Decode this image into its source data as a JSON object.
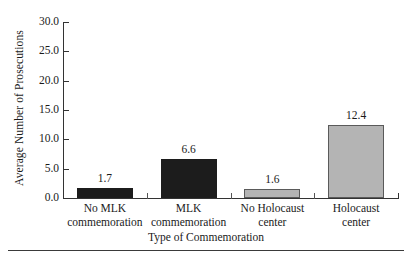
{
  "chart_data": {
    "type": "bar",
    "title": "",
    "xlabel": "Type of Commemoration",
    "ylabel": "Average Number of Prosecutions",
    "ylim": [
      0.0,
      30.0
    ],
    "ytick_labels": [
      "0.0",
      "5.0",
      "10.0",
      "15.0",
      "20.0",
      "25.0",
      "30.0"
    ],
    "ytick_values": [
      0.0,
      5.0,
      10.0,
      15.0,
      20.0,
      25.0,
      30.0
    ],
    "grid": false,
    "legend": "none",
    "categories": [
      "No MLK commemoration",
      "MLK commemoration",
      "No Holocaust center",
      "Holocaust center"
    ],
    "category_lines": [
      {
        "line1": "No MLK",
        "line2": "commemoration"
      },
      {
        "line1": "MLK",
        "line2": "commemoration"
      },
      {
        "line1": "No Holocaust",
        "line2": "center"
      },
      {
        "line1": "Holocaust",
        "line2": "center"
      }
    ],
    "values": [
      1.7,
      6.6,
      1.6,
      12.4
    ],
    "value_labels": [
      "1.7",
      "6.6",
      "1.6",
      "12.4"
    ],
    "bar_colors": [
      "#1c1c1c",
      "#1c1c1c",
      "#b4b4b4",
      "#b4b4b4"
    ],
    "bar_styles": [
      "dark",
      "dark",
      "light",
      "light"
    ]
  },
  "colors": {
    "dark_bar": "#1c1c1c",
    "light_bar": "#b4b4b4",
    "axis": "#333333",
    "text": "#1a1a1a",
    "background": "#ffffff"
  }
}
